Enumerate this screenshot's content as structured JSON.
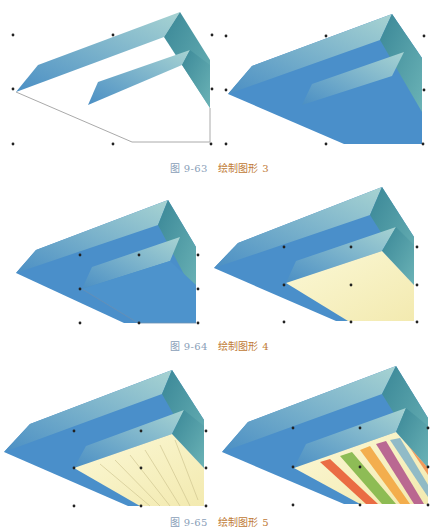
{
  "figures": [
    {
      "id": "9-63",
      "number_label": "图 9-63",
      "title": "绘制图形 3",
      "panels": [
        "outline-only",
        "filled-blue"
      ]
    },
    {
      "id": "9-64",
      "number_label": "图 9-64",
      "title": "绘制图形 4",
      "panels": [
        "blue-with-inner-outline",
        "yellow-inner-fill"
      ]
    },
    {
      "id": "9-65",
      "number_label": "图 9-65",
      "title": "绘制图形 5",
      "panels": [
        "yellow-with-stripes-outline",
        "rainbow-stripes"
      ]
    }
  ],
  "colors": {
    "blue_face": "#4a90c8",
    "teal_light": "#8fc6cc",
    "teal_dark": "#3f8a9a",
    "cream": "#f8f3c4",
    "caption_number": "#8aa0b8",
    "caption_title": "#c07a35",
    "stripe_colors": [
      "#e8552e",
      "#7cb342",
      "#f2a33a",
      "#b0508a",
      "#7fb2c8",
      "#f08a4b"
    ]
  }
}
